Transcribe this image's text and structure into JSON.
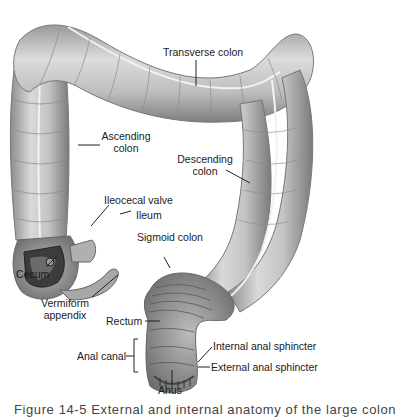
{
  "figure": {
    "caption_partial": "Figure 14-5  External and internal anatomy of the large colon"
  },
  "labels": {
    "transverse_colon": "Transverse colon",
    "ascending_colon_1": "Ascending",
    "ascending_colon_2": "colon",
    "descending_colon_1": "Descending",
    "descending_colon_2": "colon",
    "ileocecal_valve": "Ileocecal valve",
    "ileum": "Ileum",
    "sigmoid_colon": "Sigmoid colon",
    "cecum": "Cecum",
    "vermiform_appendix_1": "Vermiform",
    "vermiform_appendix_2": "appendix",
    "rectum": "Rectum",
    "anal_canal": "Anal canal",
    "internal_anal_sphincter": "Internal anal sphincter",
    "external_anal_sphincter": "External anal sphincter",
    "anus": "Anus"
  },
  "colors": {
    "background": "#ffffff",
    "tissue_light": "#d8d8d8",
    "tissue_mid": "#a8a8a8",
    "tissue_dark": "#5a5a5a",
    "label_text": "#1a1a1a",
    "leader_line": "#222222"
  }
}
